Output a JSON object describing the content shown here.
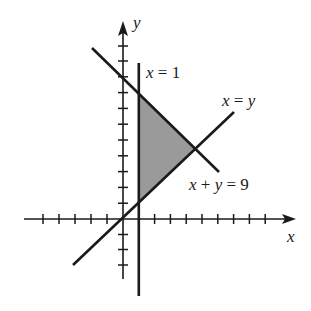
{
  "diagram": {
    "colors": {
      "ink": "#1a1a1a",
      "shade": "#9a9a9a",
      "background": "#ffffff"
    },
    "axes": {
      "x_label": "x",
      "y_label": "y",
      "origin_px": [
        123,
        219
      ],
      "unit_px": 15.8,
      "x_ticks": [
        -5,
        -4,
        -3,
        -2,
        -1,
        1,
        2,
        3,
        4,
        5,
        6,
        7,
        8,
        9
      ],
      "y_ticks": [
        -4,
        -3,
        -2,
        -1,
        1,
        2,
        3,
        4,
        5,
        6,
        7,
        8,
        9,
        10,
        11
      ]
    },
    "lines": [
      {
        "id": "x-equals-1",
        "label": "x = 1",
        "equation": "x = 1"
      },
      {
        "id": "x-equals-y",
        "label": "x = y",
        "equation": "y = x"
      },
      {
        "id": "x-plus-y-equals-9",
        "label": "x + y = 9",
        "equation": "y = 9 - x"
      }
    ],
    "shaded_region": {
      "vertices": [
        [
          1,
          1
        ],
        [
          1,
          8
        ],
        [
          4.5,
          4.5
        ]
      ]
    }
  }
}
